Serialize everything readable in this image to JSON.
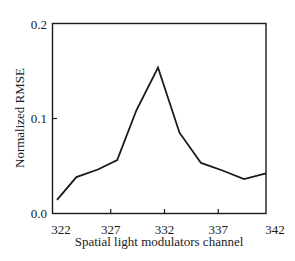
{
  "chart_data": {
    "type": "line",
    "title": "",
    "xlabel": "Spatial light modulators channel",
    "ylabel": "Normalized RMSE",
    "xlim": [
      322,
      342
    ],
    "ylim": [
      0.0,
      0.2
    ],
    "xticks": [
      "322",
      "327",
      "332",
      "337",
      "342"
    ],
    "yticks": [
      "0.0",
      "0.1",
      "0.2"
    ],
    "grid": false,
    "legend": null,
    "series": [
      {
        "name": "Normalized RMSE",
        "color": "#1a1a1a",
        "x": [
          322,
          323.8,
          325.8,
          327.6,
          329.4,
          331.4,
          333.4,
          335.4,
          337.4,
          339.4,
          342
        ],
        "y": [
          0.014,
          0.038,
          0.046,
          0.056,
          0.109,
          0.154,
          0.085,
          0.053,
          0.045,
          0.036,
          0.042
        ]
      }
    ]
  }
}
